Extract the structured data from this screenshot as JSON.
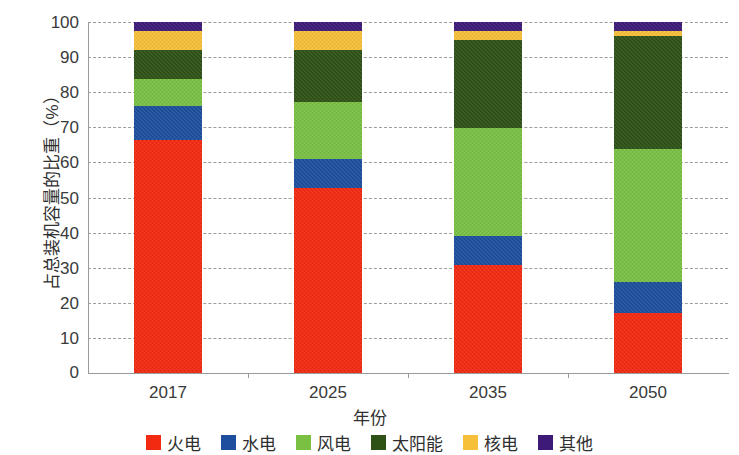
{
  "chart_data": {
    "type": "bar",
    "stacked": true,
    "title": "",
    "xlabel": "年份",
    "ylabel": "占总装机容量的比重（%）",
    "categories": [
      "2017",
      "2025",
      "2035",
      "2050"
    ],
    "ylim": [
      0,
      100
    ],
    "ytick_labels": [
      "0",
      "10",
      "20",
      "30",
      "40",
      "50",
      "60",
      "70",
      "80",
      "90",
      "100"
    ],
    "ytick_values": [
      0,
      10,
      20,
      30,
      40,
      50,
      60,
      70,
      80,
      90,
      100
    ],
    "grid": true,
    "legend_position": "bottom",
    "series": [
      {
        "name": "火电",
        "color": "#f32a12",
        "values": [
          66.4,
          52.7,
          30.8,
          17.2
        ]
      },
      {
        "name": "水电",
        "color": "#1d4f9e",
        "values": [
          9.6,
          8.3,
          8.1,
          8.8
        ]
      },
      {
        "name": "风电",
        "color": "#7ac143",
        "values": [
          7.7,
          16.2,
          30.9,
          37.7
        ]
      },
      {
        "name": "太阳能",
        "color": "#2e5216",
        "values": [
          8.3,
          14.8,
          25.2,
          32.3
        ]
      },
      {
        "name": "核电",
        "color": "#f7c03a",
        "values": [
          5.5,
          5.5,
          2.5,
          1.5
        ]
      },
      {
        "name": "其他",
        "color": "#3d1a78",
        "values": [
          2.5,
          2.5,
          2.5,
          2.5
        ]
      }
    ]
  }
}
